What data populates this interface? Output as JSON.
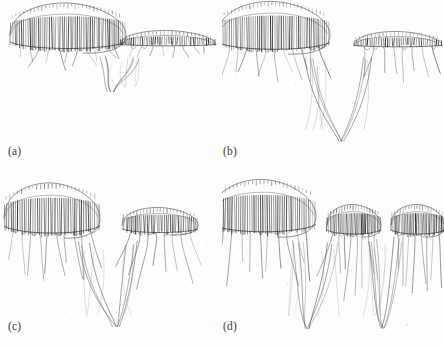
{
  "figure": {
    "title": "",
    "background_color": "#fdfdfd",
    "ink_color": "#4a4a4a",
    "ink_color_dark": "#1e1e1e",
    "panel_count": 4,
    "grid": "2x2",
    "width": 444,
    "height": 348
  },
  "panels": [
    {
      "id": "a",
      "label": "(a)",
      "caption": "",
      "description": "single continuous striated front with a long dense comb region on the left joined by a narrow neck to a lower flat striated shelf on the right; short rounded tendril loops hang beneath",
      "lobes": 2,
      "separation": "joined",
      "plume_depth": "shallow"
    },
    {
      "id": "b",
      "label": "(b)",
      "caption": "",
      "description": "left comb lobe and right comb shelf connected by a thin drooping filament; a deep narrow V-shaped trough of long filaments descends between them",
      "lobes": 2,
      "separation": "necked",
      "plume_depth": "deep"
    },
    {
      "id": "c",
      "label": "(c)",
      "caption": "",
      "description": "left rounded comb cap fully detached from a smaller right comb cap; both trail long tendrils that converge into a single V-shaped plume at bottom centre",
      "lobes": 2,
      "separation": "detached",
      "plume_depth": "deep"
    },
    {
      "id": "d",
      "label": "(d)",
      "caption": "",
      "description": "left elongated comb cap plus two discrete mushroom-shaped caps on the right, each with its own bundle of trailing tendrils forming two deep V plumes",
      "lobes": 3,
      "separation": "detached",
      "plume_depth": "deep"
    }
  ],
  "chart_data": {
    "type": "line",
    "title": "",
    "subtitle": "",
    "xlabel": "",
    "ylabel": "",
    "grid": false,
    "legend": "none",
    "series": [
      {
        "name": "panel-a",
        "caps": [
          {
            "cx": 68,
            "cy": 33,
            "rx": 58,
            "ry": 20,
            "teeth": 54,
            "tail_len": 22,
            "tail_n": 11,
            "flat_right": false
          },
          {
            "cx": 168,
            "cy": 44,
            "rx": 48,
            "ry": 9,
            "teeth": 44,
            "tail_len": 14,
            "tail_n": 8,
            "flat_right": true
          }
        ],
        "plume": {
          "depth": 0.3,
          "x": 0.5
        }
      },
      {
        "name": "panel-b",
        "caps": [
          {
            "cx": 52,
            "cy": 33,
            "rx": 56,
            "ry": 21,
            "teeth": 52,
            "tail_len": 34,
            "tail_n": 11,
            "flat_right": false
          },
          {
            "cx": 176,
            "cy": 45,
            "rx": 44,
            "ry": 9,
            "teeth": 40,
            "tail_len": 40,
            "tail_n": 8,
            "flat_right": true
          }
        ],
        "plume": {
          "depth": 0.72,
          "x": 0.54
        }
      },
      {
        "name": "panel-c",
        "caps": [
          {
            "cx": 52,
            "cy": 42,
            "rx": 48,
            "ry": 22,
            "teeth": 44,
            "tail_len": 52,
            "tail_n": 10,
            "flat_right": false
          },
          {
            "cx": 160,
            "cy": 50,
            "rx": 38,
            "ry": 11,
            "teeth": 40,
            "tail_len": 58,
            "tail_n": 8,
            "flat_right": false
          }
        ],
        "plume": {
          "depth": 0.8,
          "x": 0.52
        }
      },
      {
        "name": "panel-d",
        "caps": [
          {
            "cx": 42,
            "cy": 40,
            "rx": 52,
            "ry": 23,
            "teeth": 48,
            "tail_len": 56,
            "tail_n": 10,
            "flat_right": false
          },
          {
            "cx": 132,
            "cy": 50,
            "rx": 27,
            "ry": 13,
            "teeth": 34,
            "tail_len": 64,
            "tail_n": 8,
            "flat_right": false
          },
          {
            "cx": 196,
            "cy": 50,
            "rx": 27,
            "ry": 13,
            "teeth": 34,
            "tail_len": 64,
            "tail_n": 8,
            "flat_right": false
          }
        ],
        "plume": {
          "depth": 0.82,
          "x": 0.5
        }
      }
    ]
  }
}
